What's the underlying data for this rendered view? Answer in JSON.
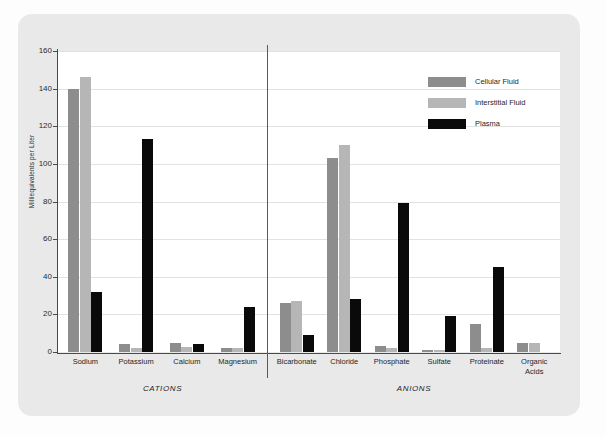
{
  "chart_data": {
    "type": "bar",
    "title": "",
    "xlabel": "",
    "ylabel": "Milliequivalents per Liter",
    "ylim": [
      0,
      160
    ],
    "yticks": [
      0,
      20,
      40,
      60,
      80,
      100,
      120,
      140,
      160
    ],
    "grid": true,
    "legend_position": "top-right",
    "categories": [
      "Sodium",
      "Potassium",
      "Calcium",
      "Magnesium",
      "Bicarbonate",
      "Chloride",
      "Phosphate",
      "Sulfate",
      "Proteinate",
      "Organic Acids"
    ],
    "groups": [
      {
        "name": "CATIONS",
        "categories": [
          "Sodium",
          "Potassium",
          "Calcium",
          "Magnesium"
        ]
      },
      {
        "name": "ANIONS",
        "categories": [
          "Bicarbonate",
          "Chloride",
          "Phosphate",
          "Sulfate",
          "Proteinate",
          "Organic Acids"
        ]
      }
    ],
    "series": [
      {
        "name": "Cellular Fluid",
        "color": "#8d8d8d",
        "values": [
          140,
          4.5,
          5,
          2,
          26,
          103,
          3,
          1,
          15,
          5
        ]
      },
      {
        "name": "Interstitial Fluid",
        "color": "#b6b6b6",
        "values": [
          146,
          2,
          2.5,
          2,
          27,
          110,
          2,
          1,
          2,
          5
        ]
      },
      {
        "name": "Plasma",
        "color": "#0a0a0a",
        "values": [
          32,
          113,
          4,
          24,
          9,
          28,
          79,
          19,
          45,
          0
        ]
      }
    ]
  },
  "theme": {
    "card_background": "#e9e9e9",
    "plot_background": "#ffffff",
    "grid_color": "#e2e2e2",
    "axis_color": "#4a4a4a",
    "text_color": "#1f1f1f"
  }
}
